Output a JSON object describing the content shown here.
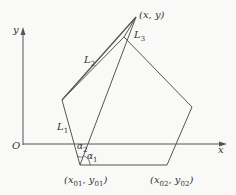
{
  "diagram": {
    "type": "geometry",
    "colors": {
      "stroke": "#555555",
      "text": "#333333",
      "background": "#f9f9f8"
    },
    "axes": {
      "x_label": "x",
      "y_label": "y",
      "origin_label": "O"
    },
    "points": {
      "apex": {
        "label": "(x, y)"
      },
      "base1": {
        "label_main": "(x",
        "sub1": "01",
        "mid": ", y",
        "sub2": "01",
        "end": ")"
      },
      "base2": {
        "label_main": "(x",
        "sub1": "02",
        "mid": ", y",
        "sub2": "02",
        "end": ")"
      }
    },
    "links": {
      "L1": {
        "main": "L",
        "sub": "1"
      },
      "L2": {
        "main": "L",
        "sub": "2"
      },
      "L3": {
        "main": "L",
        "sub": "3"
      }
    },
    "angles": {
      "alpha1": {
        "main": "α",
        "sub": "1"
      },
      "alpha2": {
        "main": "α",
        "sub": "2"
      }
    }
  }
}
